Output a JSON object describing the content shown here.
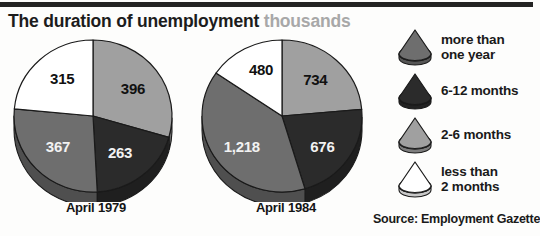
{
  "header": {
    "title_main": "The duration of unemployment",
    "title_unit": "thousands"
  },
  "source_note": "Source: Employment Gazette",
  "legend": {
    "items": [
      {
        "label_line1": "more than",
        "label_line2": "one year",
        "color": "#6e6e6e",
        "icon": "pie-wedge-icon"
      },
      {
        "label_line1": "6-12 months",
        "label_line2": "",
        "color": "#2b2b2b",
        "icon": "pie-wedge-icon"
      },
      {
        "label_line1": "2-6 months",
        "label_line2": "",
        "color": "#a0a0a0",
        "icon": "pie-wedge-icon"
      },
      {
        "label_line1": "less than",
        "label_line2": "2 months",
        "color": "#ffffff",
        "icon": "pie-wedge-icon"
      }
    ]
  },
  "colors": {
    "more_than_one_year": "#6e6e6e",
    "six_to_twelve_months": "#2b2b2b",
    "two_to_six_months": "#a0a0a0",
    "less_than_two_months": "#ffffff",
    "outline": "#1a1a1a",
    "title_unit": "#a8a8a8"
  },
  "chart_data": [
    {
      "type": "pie",
      "title": "April 1979",
      "unit": "thousands",
      "total": 1341,
      "categories": [
        "2-6 months",
        "6-12 months",
        "more than one year",
        "less than 2 months"
      ],
      "values": [
        396,
        263,
        367,
        315
      ],
      "labels": [
        "396",
        "263",
        "367",
        "315"
      ],
      "colors": [
        "#a0a0a0",
        "#2b2b2b",
        "#6e6e6e",
        "#ffffff"
      ],
      "start_angle_deg": 0,
      "three_d": true,
      "legend_position": "right"
    },
    {
      "type": "pie",
      "title": "April 1984",
      "unit": "thousands",
      "total": 3108,
      "categories": [
        "2-6 months",
        "6-12 months",
        "more than one year",
        "less than 2 months"
      ],
      "values": [
        734,
        676,
        1218,
        480
      ],
      "labels": [
        "734",
        "676",
        "1,218",
        "480"
      ],
      "colors": [
        "#a0a0a0",
        "#2b2b2b",
        "#6e6e6e",
        "#ffffff"
      ],
      "start_angle_deg": 0,
      "three_d": true,
      "legend_position": "right"
    }
  ]
}
